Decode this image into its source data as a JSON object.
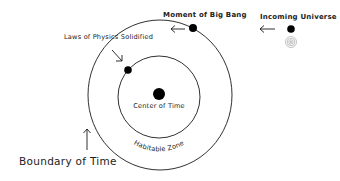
{
  "diagram": {
    "labels": {
      "laws_of_physics": "Laws of Physics Solidified",
      "big_bang": "Moment of Big Bang",
      "incoming_universe": "Incoming Universe",
      "center_of_time": "Center of Time",
      "habitable_zone": "Habitable Zone",
      "boundary_of_time": "Boundary of Time"
    },
    "colors": {
      "line": "#1a1a1a",
      "dot": "#000000",
      "faint_rings": "#9a9a9a",
      "background": "#ffffff"
    }
  }
}
